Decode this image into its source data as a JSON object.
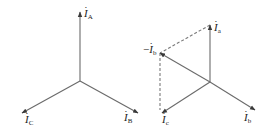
{
  "diagram": {
    "title": "",
    "colors": {
      "line": "#6b6b6b",
      "dash": "#7a7a7a",
      "text": "#222222",
      "background": "#ffffff"
    },
    "left": {
      "name": "primary-phasors",
      "center": [
        80,
        81
      ],
      "vectors": [
        {
          "id": "A",
          "label_main": "I",
          "label_sub": "A",
          "to": [
            80,
            12
          ],
          "label_pos": [
            84,
            8
          ]
        },
        {
          "id": "B",
          "label_main": "I",
          "label_sub": "B",
          "to": [
            138,
            113
          ],
          "label_pos": [
            124,
            112
          ]
        },
        {
          "id": "C",
          "label_main": "I",
          "label_sub": "C",
          "to": [
            22,
            113
          ],
          "label_pos": [
            25,
            114
          ]
        }
      ]
    },
    "right": {
      "name": "secondary-phasors",
      "center": [
        210,
        82
      ],
      "vectors": [
        {
          "id": "a",
          "label_main": "I",
          "label_sub": "a",
          "to": [
            210,
            25
          ],
          "label_pos": [
            214,
            22
          ]
        },
        {
          "id": "b",
          "label_main": "I",
          "label_sub": "b",
          "to": [
            255,
            110
          ],
          "label_pos": [
            244,
            112
          ]
        },
        {
          "id": "neg-b",
          "label_main": "I",
          "label_sub": "b",
          "prefix": "−",
          "to": [
            160,
            53
          ],
          "label_pos": [
            143,
            44
          ]
        },
        {
          "id": "c",
          "label_main": "I",
          "label_sub": "c",
          "to": [
            162,
            113
          ],
          "label_pos": [
            162,
            114
          ]
        }
      ],
      "dashed": [
        {
          "from": [
            210,
            25
          ],
          "to": [
            160,
            53
          ]
        },
        {
          "from": [
            160,
            53
          ],
          "to": [
            160,
            110
          ]
        }
      ]
    }
  }
}
